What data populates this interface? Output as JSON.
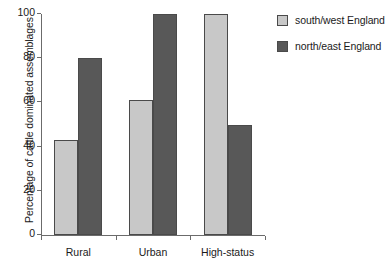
{
  "chart_data": {
    "type": "bar",
    "title": "",
    "subtitle": "",
    "xlabel": "",
    "ylabel": "Percentage of cattle dominated assemblages",
    "categories": [
      "Rural",
      "Urban",
      "High-status"
    ],
    "series": [
      {
        "name": "south/west England",
        "color": "#c8c8c8",
        "values": [
          43,
          61,
          100
        ]
      },
      {
        "name": "north/east England",
        "color": "#585858",
        "values": [
          80,
          100,
          50
        ]
      }
    ],
    "ylim": [
      0,
      100
    ],
    "ytick_labels": [
      "0",
      "20",
      "40",
      "60",
      "80",
      "100"
    ],
    "ytick_values": [
      0,
      20,
      40,
      60,
      80,
      100
    ],
    "grid": false,
    "legend_position": "top-right",
    "axis_color": "#6b6b6b",
    "bar_edge_color": "#4a4a4a"
  }
}
